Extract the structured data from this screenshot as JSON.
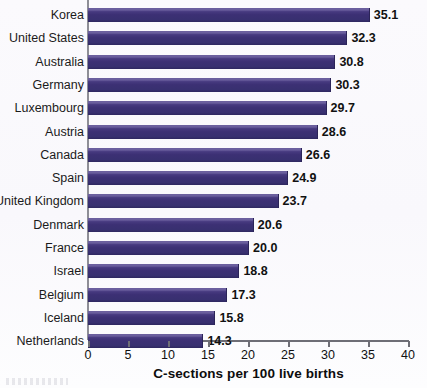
{
  "chart_data": {
    "type": "bar",
    "orientation": "horizontal",
    "title": "",
    "xlabel": "C-sections per 100 live births",
    "ylabel": "",
    "xlim": [
      0,
      40
    ],
    "xticks": [
      0,
      5,
      10,
      15,
      20,
      25,
      30,
      35,
      40
    ],
    "grid": false,
    "legend": null,
    "bar_color": "#3c3074",
    "categories": [
      "Korea",
      "United States",
      "Australia",
      "Germany",
      "Luxembourg",
      "Austria",
      "Canada",
      "Spain",
      "United Kingdom",
      "Denmark",
      "France",
      "Israel",
      "Belgium",
      "Iceland",
      "Netherlands"
    ],
    "values": [
      35.1,
      32.3,
      30.8,
      30.3,
      29.7,
      28.6,
      26.6,
      24.9,
      23.7,
      20.6,
      20.0,
      18.8,
      17.3,
      15.8,
      14.3
    ],
    "value_labels": [
      "35.1",
      "32.3",
      "30.8",
      "30.3",
      "29.7",
      "28.6",
      "26.6",
      "24.9",
      "23.7",
      "20.6",
      "20.0",
      "18.8",
      "17.3",
      "15.8",
      "14.3"
    ],
    "xtick_labels": [
      "0",
      "5",
      "10",
      "15",
      "20",
      "25",
      "30",
      "35",
      "40"
    ]
  }
}
